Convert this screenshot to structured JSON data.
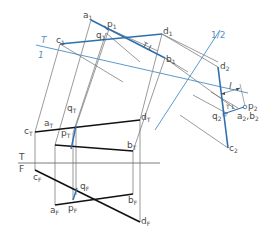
{
  "figure": {
    "colors": {
      "construction": "#6e6e6e",
      "object": "#111111",
      "blue": "#2f6fad",
      "light_blue": "#5b9ad0",
      "label": "#4a4a4a"
    },
    "fold_lines": {
      "tf": {
        "top_label": "T",
        "bottom_label": "F"
      },
      "t1": {
        "top_label": "T",
        "bottom_label": "1"
      },
      "one_two": {
        "label": "1/2"
      }
    },
    "labels": {
      "a1": {
        "main": "a",
        "sub": "1"
      },
      "p1": {
        "main": "p",
        "sub": "1"
      },
      "q1": {
        "main": "q",
        "sub": "1"
      },
      "c1": {
        "main": "c",
        "sub": "1"
      },
      "d1": {
        "main": "d",
        "sub": "1"
      },
      "b1": {
        "main": "b",
        "sub": "1"
      },
      "tl": {
        "main": "T L"
      },
      "d2": {
        "main": "d",
        "sub": "2"
      },
      "c2": {
        "main": "c",
        "sub": "2"
      },
      "q2": {
        "main": "q",
        "sub": "2"
      },
      "p2": {
        "main": "p",
        "sub": "2"
      },
      "a2b2": {
        "main": "a",
        "sub": "2",
        "main2": ",b",
        "sub2": "2"
      },
      "l": {
        "main": "l"
      },
      "tl2": {
        "main": "T L"
      },
      "cT": {
        "main": "c",
        "sub": "T"
      },
      "qT": {
        "main": "q",
        "sub": "T"
      },
      "dT": {
        "main": "d",
        "sub": "T"
      },
      "aT": {
        "main": "a",
        "sub": "T"
      },
      "pT": {
        "main": "p",
        "sub": "T"
      },
      "bT": {
        "main": "b",
        "sub": "T"
      },
      "cF": {
        "main": "c",
        "sub": "F"
      },
      "qF": {
        "main": "q",
        "sub": "F"
      },
      "aF": {
        "main": "a",
        "sub": "F"
      },
      "pF": {
        "main": "p",
        "sub": "F"
      },
      "bF": {
        "main": "b",
        "sub": "F"
      },
      "dF": {
        "main": "d",
        "sub": "F"
      }
    }
  }
}
